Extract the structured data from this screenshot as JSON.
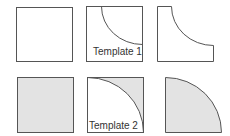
{
  "colors": {
    "stroke": "#555555",
    "fill": "#e3e3e3",
    "background": "#ffffff"
  },
  "rows": [
    {
      "name": "top-row",
      "shapes": [
        {
          "name": "plain-square",
          "filled": false
        },
        {
          "name": "template-1-square",
          "label": "Template 1",
          "arc": "quarter arc from top edge to right edge, center top-right corner"
        },
        {
          "name": "result-1-shape",
          "description": "square with concave top-right corner cut"
        }
      ]
    },
    {
      "name": "bottom-row",
      "shapes": [
        {
          "name": "filled-square",
          "filled": true
        },
        {
          "name": "template-2-square",
          "label": "Template 2",
          "arc": "quarter arc from top-left to bottom-right, upper-right shaded"
        },
        {
          "name": "result-2-shape",
          "description": "filled quarter circle, center bottom-left"
        }
      ]
    }
  ],
  "labels": {
    "template1": "Template 1",
    "template2": "Template 2"
  }
}
